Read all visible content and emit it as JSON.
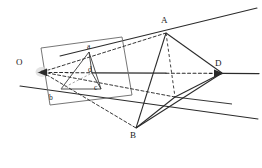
{
  "figure": {
    "width": 262,
    "height": 168,
    "background_color": "#ffffff",
    "stroke_color": "#2b2b2b",
    "faint_stroke_color": "#8a8a8a",
    "labels": {
      "center_of_projection": "O",
      "vertex_a_large": "A",
      "vertex_b_large": "B",
      "vertex_d_large": "D",
      "vertex_a_small": "a",
      "vertex_b_small": "b",
      "vertex_c_small": "c",
      "vertex_d_small": "d"
    },
    "label_positions": {
      "O": {
        "x": 16,
        "y": 58,
        "size": "major"
      },
      "A": {
        "x": 161,
        "y": 16,
        "size": "major"
      },
      "B": {
        "x": 130,
        "y": 131,
        "size": "major"
      },
      "D": {
        "x": 215,
        "y": 59,
        "size": "major"
      },
      "a": {
        "x": 87,
        "y": 43,
        "size": "minor"
      },
      "b": {
        "x": 49,
        "y": 94,
        "size": "minor"
      },
      "c": {
        "x": 94,
        "y": 84,
        "size": "minor"
      },
      "d": {
        "x": 88,
        "y": 66,
        "size": "minor"
      }
    },
    "points": {
      "O": {
        "x": 42,
        "y": 72
      },
      "A": {
        "x": 166,
        "y": 33
      },
      "B": {
        "x": 136,
        "y": 128
      },
      "D": {
        "x": 222,
        "y": 73
      },
      "C": {
        "x": 175,
        "y": 97
      },
      "a": {
        "x": 89,
        "y": 52
      },
      "b": {
        "x": 61,
        "y": 89
      },
      "c": {
        "x": 101,
        "y": 89
      },
      "d": {
        "x": 92,
        "y": 73
      },
      "plane_tl": {
        "x": 41,
        "y": 48
      },
      "plane_tr": {
        "x": 122,
        "y": 37
      },
      "plane_br": {
        "x": 132,
        "y": 95
      },
      "plane_bl": {
        "x": 50,
        "y": 105
      },
      "ray_A_far": {
        "x": 257,
        "y": 8
      },
      "ray_A_near": {
        "x": 60,
        "y": 56
      },
      "ray_B_far": {
        "x": 258,
        "y": 119
      },
      "ray_B_near": {
        "x": 20,
        "y": 86
      },
      "ray_D_far": {
        "x": 259,
        "y": 73
      },
      "ray_C_far": {
        "x": 232,
        "y": 104
      },
      "ray_C_near": {
        "x": 136,
        "y": 128
      },
      "axis_left": {
        "x": 38,
        "y": 72
      }
    },
    "edges": [
      {
        "name": "plane-edge-top",
        "style": "solid"
      },
      {
        "name": "plane-edge-right",
        "style": "solid"
      },
      {
        "name": "plane-edge-bottom",
        "style": "solid"
      },
      {
        "name": "plane-edge-left",
        "style": "solid"
      },
      {
        "name": "projector-O-A",
        "style": "dashed"
      },
      {
        "name": "projector-O-B",
        "style": "dashed"
      },
      {
        "name": "projector-O-D",
        "style": "dashed"
      },
      {
        "name": "projector-O-C",
        "style": "dashed"
      },
      {
        "name": "tetra-edge-A-B",
        "style": "solid"
      },
      {
        "name": "tetra-edge-A-D",
        "style": "solid"
      },
      {
        "name": "tetra-edge-A-C",
        "style": "dashed"
      },
      {
        "name": "tetra-edge-B-D",
        "style": "solid"
      },
      {
        "name": "tetra-edge-B-C",
        "style": "solid"
      },
      {
        "name": "tetra-edge-C-D",
        "style": "solid"
      },
      {
        "name": "small-tetra-edge-a-b",
        "style": "solid"
      },
      {
        "name": "small-tetra-edge-a-c",
        "style": "solid"
      },
      {
        "name": "small-tetra-edge-a-d",
        "style": "solid"
      },
      {
        "name": "small-tetra-edge-b-c",
        "style": "solid"
      },
      {
        "name": "small-tetra-edge-b-d",
        "style": "dashed"
      },
      {
        "name": "small-tetra-edge-c-d",
        "style": "solid"
      }
    ]
  }
}
